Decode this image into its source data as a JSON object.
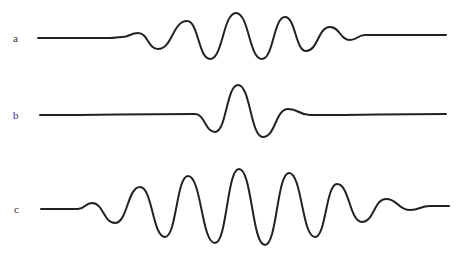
{
  "figure": {
    "panels": [
      {
        "label": "a",
        "description": "wave packet with several oscillations",
        "points": [
          [
            38,
            38
          ],
          [
            110,
            38
          ],
          [
            122,
            37
          ],
          [
            138,
            33
          ],
          [
            158,
            49
          ],
          [
            187,
            21
          ],
          [
            210,
            59
          ],
          [
            236,
            13
          ],
          [
            262,
            59
          ],
          [
            285,
            17
          ],
          [
            306,
            51
          ],
          [
            330,
            27
          ],
          [
            350,
            40
          ],
          [
            365,
            35
          ],
          [
            446,
            35
          ]
        ]
      },
      {
        "label": "b",
        "description": "short single-pulse wavelet",
        "points": [
          [
            40,
            115
          ],
          [
            195,
            114
          ],
          [
            215,
            132
          ],
          [
            238,
            85
          ],
          [
            263,
            137
          ],
          [
            288,
            109
          ],
          [
            310,
            115
          ],
          [
            446,
            114
          ]
        ]
      },
      {
        "label": "c",
        "description": "long wave packet with many oscillations",
        "points": [
          [
            41,
            209
          ],
          [
            78,
            209
          ],
          [
            92,
            203
          ],
          [
            115,
            223
          ],
          [
            140,
            187
          ],
          [
            165,
            237
          ],
          [
            188,
            176
          ],
          [
            215,
            243
          ],
          [
            239,
            169
          ],
          [
            265,
            245
          ],
          [
            289,
            173
          ],
          [
            315,
            237
          ],
          [
            337,
            184
          ],
          [
            362,
            222
          ],
          [
            386,
            199
          ],
          [
            410,
            210
          ],
          [
            430,
            206
          ],
          [
            449,
            206
          ]
        ]
      }
    ],
    "stroke_color": "#222222",
    "background": "#ffffff"
  }
}
